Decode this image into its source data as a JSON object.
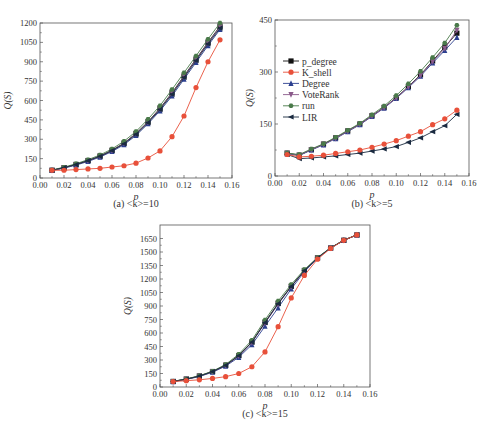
{
  "chart_data": [
    {
      "id": "a",
      "type": "line",
      "title": "",
      "caption": "(a) <k>=10",
      "xlabel": "p",
      "ylabel": "Q(S)",
      "xlim": [
        0.0,
        0.16
      ],
      "ylim": [
        0,
        1200
      ],
      "xticks": [
        "0.00",
        "0.02",
        "0.04",
        "0.06",
        "0.08",
        "0.10",
        "0.12",
        "0.14",
        "0.16"
      ],
      "yticks": [
        "0",
        "150",
        "300",
        "450",
        "600",
        "750",
        "900",
        "1050",
        "1200"
      ],
      "grid": false,
      "legend_position": "none",
      "x": [
        0.01,
        0.02,
        0.03,
        0.04,
        0.05,
        0.06,
        0.07,
        0.08,
        0.09,
        0.1,
        0.11,
        0.12,
        0.13,
        0.14,
        0.15
      ],
      "series": [
        {
          "name": "p_degree",
          "color": "#111111",
          "marker": "square",
          "values": [
            60,
            80,
            105,
            135,
            170,
            215,
            270,
            345,
            435,
            540,
            660,
            790,
            920,
            1050,
            1175
          ]
        },
        {
          "name": "K_shell",
          "color": "#e8503a",
          "marker": "circle",
          "values": [
            60,
            60,
            65,
            70,
            75,
            85,
            95,
            115,
            155,
            210,
            320,
            480,
            700,
            900,
            1070
          ]
        },
        {
          "name": "Degree",
          "color": "#2b3f8f",
          "marker": "triangle-up",
          "values": [
            58,
            76,
            100,
            128,
            162,
            205,
            258,
            330,
            420,
            520,
            635,
            765,
            895,
            1025,
            1150
          ]
        },
        {
          "name": "VoteRank",
          "color": "#8a5a8a",
          "marker": "triangle-down",
          "values": [
            60,
            79,
            104,
            133,
            168,
            213,
            268,
            342,
            432,
            535,
            655,
            785,
            915,
            1045,
            1170
          ]
        },
        {
          "name": "run",
          "color": "#4a7a4a",
          "marker": "hexagon",
          "values": [
            62,
            84,
            110,
            142,
            178,
            225,
            285,
            360,
            455,
            560,
            685,
            815,
            945,
            1075,
            1200
          ]
        },
        {
          "name": "LIR",
          "color": "#1a2a40",
          "marker": "triangle-left",
          "values": [
            60,
            80,
            104,
            134,
            168,
            212,
            265,
            338,
            428,
            530,
            648,
            778,
            908,
            1038,
            1160
          ]
        }
      ]
    },
    {
      "id": "b",
      "type": "line",
      "title": "",
      "caption": "(b) <k>=5",
      "xlabel": "p",
      "ylabel": "Q(S)",
      "xlim": [
        0.0,
        0.16
      ],
      "ylim": [
        0,
        450
      ],
      "xticks": [
        "0.00",
        "0.02",
        "0.04",
        "0.06",
        "0.08",
        "0.10",
        "0.12",
        "0.14",
        "0.16"
      ],
      "yticks": [
        "0",
        "150",
        "300",
        "450"
      ],
      "grid": false,
      "legend_position": "upper left",
      "x": [
        0.01,
        0.02,
        0.03,
        0.04,
        0.05,
        0.06,
        0.07,
        0.08,
        0.09,
        0.1,
        0.11,
        0.12,
        0.13,
        0.14,
        0.15
      ],
      "series": [
        {
          "name": "p_degree",
          "color": "#111111",
          "marker": "square",
          "values": [
            66,
            60,
            76,
            92,
            110,
            130,
            150,
            174,
            198,
            226,
            258,
            292,
            332,
            372,
            412
          ]
        },
        {
          "name": "K_shell",
          "color": "#e8503a",
          "marker": "circle",
          "values": [
            62,
            55,
            57,
            60,
            65,
            70,
            75,
            83,
            92,
            102,
            115,
            128,
            148,
            165,
            190
          ]
        },
        {
          "name": "Degree",
          "color": "#2b3f8f",
          "marker": "triangle-up",
          "values": [
            64,
            59,
            75,
            90,
            108,
            128,
            148,
            172,
            196,
            224,
            255,
            288,
            326,
            362,
            400
          ]
        },
        {
          "name": "VoteRank",
          "color": "#8a5a8a",
          "marker": "triangle-down",
          "values": [
            65,
            60,
            76,
            91,
            109,
            129,
            149,
            173,
            197,
            225,
            257,
            290,
            330,
            368,
            420
          ]
        },
        {
          "name": "run",
          "color": "#4a7a4a",
          "marker": "hexagon",
          "values": [
            66,
            62,
            78,
            93,
            112,
            132,
            152,
            177,
            202,
            232,
            266,
            302,
            342,
            384,
            435
          ]
        },
        {
          "name": "LIR",
          "color": "#1a2a40",
          "marker": "triangle-left",
          "values": [
            62,
            50,
            52,
            55,
            58,
            62,
            66,
            72,
            78,
            85,
            97,
            110,
            128,
            145,
            178
          ]
        }
      ]
    },
    {
      "id": "c",
      "type": "line",
      "title": "",
      "caption": "(c) <k>=15",
      "xlabel": "p",
      "ylabel": "Q(S)",
      "xlim": [
        0.0,
        0.16
      ],
      "ylim": [
        0,
        1800
      ],
      "xticks": [
        "0.00",
        "0.02",
        "0.04",
        "0.06",
        "0.08",
        "0.10",
        "0.12",
        "0.14",
        "0.16"
      ],
      "yticks": [
        "0",
        "150",
        "300",
        "450",
        "600",
        "750",
        "900",
        "1050",
        "1200",
        "1350",
        "1500",
        "1650"
      ],
      "grid": false,
      "legend_position": "none",
      "x": [
        0.01,
        0.02,
        0.03,
        0.04,
        0.05,
        0.06,
        0.07,
        0.08,
        0.09,
        0.1,
        0.11,
        0.12,
        0.13,
        0.14,
        0.15
      ],
      "series": [
        {
          "name": "p_degree",
          "color": "#111111",
          "marker": "square",
          "values": [
            62,
            88,
            122,
            172,
            242,
            350,
            500,
            720,
            930,
            1120,
            1295,
            1435,
            1545,
            1630,
            1690
          ]
        },
        {
          "name": "K_shell",
          "color": "#e8503a",
          "marker": "circle",
          "values": [
            60,
            70,
            80,
            95,
            115,
            150,
            225,
            390,
            670,
            990,
            1240,
            1420,
            1540,
            1630,
            1690
          ]
        },
        {
          "name": "Degree",
          "color": "#2b3f8f",
          "marker": "triangle-up",
          "values": [
            60,
            84,
            116,
            164,
            232,
            330,
            470,
            675,
            880,
            1090,
            1280,
            1430,
            1545,
            1630,
            1690
          ]
        },
        {
          "name": "VoteRank",
          "color": "#8a5a8a",
          "marker": "triangle-down",
          "values": [
            61,
            86,
            120,
            170,
            240,
            345,
            495,
            710,
            920,
            1115,
            1290,
            1433,
            1545,
            1630,
            1690
          ]
        },
        {
          "name": "run",
          "color": "#4a7a4a",
          "marker": "hexagon",
          "values": [
            63,
            90,
            125,
            176,
            250,
            365,
            520,
            745,
            955,
            1140,
            1305,
            1440,
            1548,
            1632,
            1692
          ]
        },
        {
          "name": "LIR",
          "color": "#1a2a40",
          "marker": "triangle-left",
          "values": [
            62,
            87,
            121,
            171,
            241,
            348,
            498,
            715,
            925,
            1118,
            1292,
            1434,
            1545,
            1630,
            1690
          ]
        }
      ]
    }
  ],
  "legend": {
    "items": [
      "p_degree",
      "K_shell",
      "Degree",
      "VoteRank",
      "run",
      "LIR"
    ]
  },
  "captions": {
    "a": "(a) <k>=10",
    "b": "(b) <k>=5",
    "c": "(c) <k>=15",
    "figure": "不同算法在不同平均度网络上的Q(S)对比"
  },
  "axis_labels": {
    "x": "p",
    "y": "Q(S)"
  }
}
